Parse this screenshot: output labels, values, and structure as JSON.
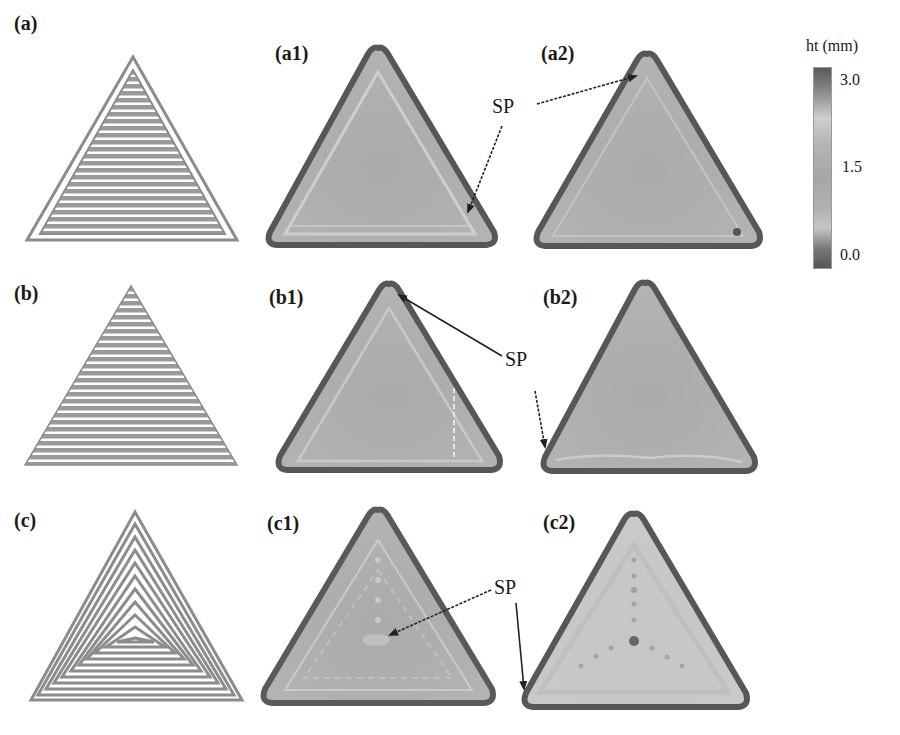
{
  "figure": {
    "panels": [
      {
        "id": "a",
        "label": "(a)",
        "kind": "toolpath",
        "pattern": "zigzag-with-contour"
      },
      {
        "id": "a1",
        "label": "(a1)",
        "kind": "height-map"
      },
      {
        "id": "a2",
        "label": "(a2)",
        "kind": "height-map"
      },
      {
        "id": "b",
        "label": "(b)",
        "kind": "toolpath",
        "pattern": "zigzag"
      },
      {
        "id": "b1",
        "label": "(b1)",
        "kind": "height-map"
      },
      {
        "id": "b2",
        "label": "(b2)",
        "kind": "height-map"
      },
      {
        "id": "c",
        "label": "(c)",
        "kind": "toolpath",
        "pattern": "contour-spiral"
      },
      {
        "id": "c1",
        "label": "(c1)",
        "kind": "height-map"
      },
      {
        "id": "c2",
        "label": "(c2)",
        "kind": "height-map"
      }
    ],
    "annotations": [
      {
        "text": "SP",
        "row": "a",
        "points_to": [
          "a1 bottom-right corner",
          "a2 apex"
        ]
      },
      {
        "text": "SP",
        "row": "b",
        "points_to": [
          "b1 apex",
          "b2 bottom-left corner"
        ]
      },
      {
        "text": "SP",
        "row": "c",
        "points_to": [
          "c1 center",
          "c2 bottom-left corner"
        ]
      }
    ],
    "colorbar": {
      "title": "ht (mm)",
      "ticks": [
        "3.0",
        "1.5",
        "0.0"
      ],
      "min": 0.0,
      "max": 3.0
    }
  },
  "colors": {
    "outline_dark": "#555555",
    "fill_mid": "#a9a9a9",
    "fill_light": "#cfcfcf",
    "path_line": "#8c8c8c",
    "arrow": "#222222"
  }
}
